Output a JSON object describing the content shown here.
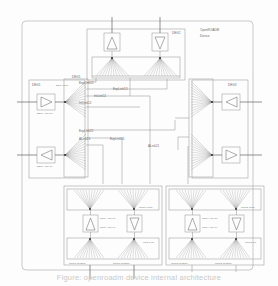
{
  "figure": {
    "device_label_line1": "OpenROADM",
    "device_label_line2": "Device",
    "caption": "Figure: openroadm device internal architecture"
  },
  "degrees": {
    "deg1": {
      "outer_label": "DEG1",
      "inner_label": "DEG1",
      "wss_label": "DEG-WSS"
    },
    "deg2": {
      "label": "DEG2"
    },
    "deg3": {
      "label": "DEG3"
    }
  },
  "amplifiers": {
    "deg_amp_rx": "DEG-AMP-RX",
    "deg_amp_tx": "DEG-AMP-TX",
    "srg_amp_rx": "SRG-AMP-RX",
    "srg_amp_tx": "SRG-AMP-TX"
  },
  "links": [
    {
      "name": "ExpLink12",
      "x": 79,
      "y": 84
    },
    {
      "name": "ExpLink13",
      "x": 113,
      "y": 90
    },
    {
      "name": "IntLink11",
      "x": 94,
      "y": 97
    },
    {
      "name": "IntLink12",
      "x": 79,
      "y": 104
    },
    {
      "name": "ExpLink21",
      "x": 79,
      "y": 132
    },
    {
      "name": "ALink13",
      "x": 79,
      "y": 140
    },
    {
      "name": "ExpLink31",
      "x": 110,
      "y": 140
    },
    {
      "name": "ALink21",
      "x": 148,
      "y": 147
    }
  ],
  "srg": {
    "srg1_wss": "SRG1-WSS",
    "srg1_cp": "SRG1-CP",
    "srg1_pp": "SRG1-PP",
    "srg1_client_a": "SRG1-CLIENT",
    "srg1_client_b": "SRG1-CLIENT",
    "srg2_wss": "SRG2-WSS",
    "srg2_cp": "SRG2-CP",
    "srg2_client_a": "SRG2-CLIENT",
    "srg2_client_b": "SRG2-CLIENT"
  },
  "colors": {
    "background": "#fdfdfd",
    "box_stroke": "#9c9c9c",
    "wire": "#4a4a4a",
    "text": "#6b6b6b"
  }
}
